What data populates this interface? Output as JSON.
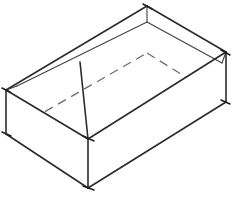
{
  "figure": {
    "background_color": "#ffffff",
    "visible_edge_color": "#2b2b2f",
    "hidden_edge_color": "#6d6d78",
    "projection": "isometric-oblique",
    "canvas": {
      "width": 232,
      "height": 205
    }
  },
  "geometry": {
    "vertices": {
      "top_rim_left": {
        "x": 6,
        "y": 90
      },
      "top_rim_front": {
        "x": 88,
        "y": 139
      },
      "top_rim_right": {
        "x": 226,
        "y": 52
      },
      "top_rim_back": {
        "x": 147,
        "y": 6
      },
      "top_rim_back_inner": {
        "x": 147,
        "y": 22
      },
      "bottom_left": {
        "x": 6,
        "y": 134
      },
      "bottom_front": {
        "x": 88,
        "y": 188
      },
      "bottom_right": {
        "x": 226,
        "y": 102
      },
      "hidden_back_top": {
        "x": 147,
        "y": 53
      },
      "rim_inner_left": {
        "x": 18,
        "y": 86
      },
      "rim_inner_front": {
        "x": 80,
        "y": 62
      }
    },
    "edges_visible": [
      {
        "name": "top-left-to-back",
        "from": "top_rim_left",
        "to": "top_rim_back"
      },
      {
        "name": "top-back-to-right",
        "from": "top_rim_back",
        "to": "top_rim_right"
      },
      {
        "name": "top-left-to-front",
        "from": "top_rim_left",
        "to": "top_rim_front"
      },
      {
        "name": "top-front-to-right",
        "from": "top_rim_front",
        "to": "top_rim_right"
      },
      {
        "name": "vertical-left",
        "from": "top_rim_left",
        "to": "bottom_left"
      },
      {
        "name": "vertical-front",
        "from": "top_rim_front",
        "to": "bottom_front"
      },
      {
        "name": "vertical-right",
        "from": "top_rim_right",
        "to": "bottom_right"
      },
      {
        "name": "bottom-left-to-front",
        "from": "bottom_left",
        "to": "bottom_front"
      },
      {
        "name": "bottom-front-to-right",
        "from": "bottom_front",
        "to": "bottom_right"
      }
    ],
    "edges_hidden": [
      {
        "name": "hidden-left-to-back",
        "from": "bottom_left",
        "to": "hidden_back_top"
      },
      {
        "name": "hidden-back-to-right",
        "from": "hidden_back_top",
        "to": "bottom_right"
      }
    ],
    "rim_band": {
      "name": "box-lid-rim-band",
      "note": "narrow double-line band along the two far top edges giving the rim thickness"
    },
    "inner_fold": {
      "name": "inner-fold-line",
      "from": {
        "x": 80,
        "y": 62
      },
      "to": {
        "x": 88,
        "y": 139
      }
    }
  },
  "labels": {
    "caption": "",
    "annotations": []
  }
}
